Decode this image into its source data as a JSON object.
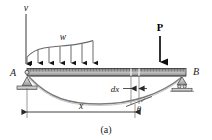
{
  "figure": {
    "caption": "(a)",
    "background_color": "#ffffff"
  },
  "labels": {
    "deflection_axis": "v",
    "distributed_load": "w",
    "point_load": "P",
    "support_left": "A",
    "support_right": "B",
    "element_width": "dx",
    "distance": "x",
    "slope_angle": "θ"
  },
  "colors": {
    "beam_fill_dark": "#8c8c8c",
    "beam_fill_light": "#d6d6d6",
    "beam_outline": "#3a3a3a",
    "support_fill": "#c9c9c9",
    "support_outline": "#4a4a4a",
    "load_line": "#4a4a4a",
    "arrow_dark": "#1a1a1a",
    "curve_color": "#6e6e6e",
    "dimension_line": "#3a3a3a",
    "text_color": "#1a1a1a"
  },
  "geometry": {
    "beam_left_x": 27,
    "beam_right_x": 186,
    "beam_top_y": 68,
    "beam_bottom_y": 77,
    "dx_left_x": 131,
    "dx_right_x": 139,
    "x_dimension_y": 110,
    "deflection_axis_x": 26,
    "point_load_x": 160
  },
  "distributed_load": {
    "arrow_count": 7,
    "arrow_x_positions": [
      27,
      38,
      49,
      60,
      71,
      82,
      93
    ],
    "profile_y_top": [
      57,
      50,
      48,
      47,
      46,
      44,
      41
    ],
    "description": "varying distributed load w acting downward on left portion of beam"
  },
  "point_load": {
    "label": "P",
    "x": 160,
    "tip_y": 67,
    "tail_y": 33,
    "bold": true
  },
  "elastic_curve": {
    "description": "sagging deflection curve of beam from A to B",
    "max_sag_y": 96
  }
}
